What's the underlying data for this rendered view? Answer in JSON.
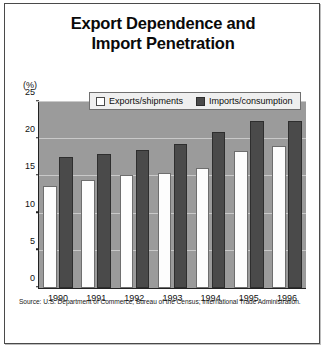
{
  "figure": {
    "title_line1": "Export Dependence and",
    "title_line2": "Import Penetration",
    "source": "Source: U.S. Department of Commerce; Bureau of the Census; International Trade Administration."
  },
  "chart_data": {
    "type": "bar",
    "title": "Export Dependence and Import Penetration",
    "xlabel": "",
    "ylabel": "(%)",
    "yunit": "(%)",
    "ylim": [
      0,
      25
    ],
    "yticks": [
      0,
      5,
      10,
      15,
      20,
      25
    ],
    "ytick_labels": [
      "0",
      "5",
      "10",
      "15",
      "20",
      "25"
    ],
    "grid": true,
    "legend_position": "top-center",
    "categories": [
      "1990",
      "1991",
      "1992",
      "1993",
      "1994",
      "1995",
      "1996"
    ],
    "series": [
      {
        "name": "Exports/shipments",
        "color": "#ffffff",
        "values": [
          13.7,
          14.5,
          15.2,
          15.4,
          16.1,
          18.4,
          19.1
        ]
      },
      {
        "name": "Imports/consumption",
        "color": "#4a4a4a",
        "values": [
          17.6,
          18.0,
          18.6,
          19.3,
          21.0,
          22.4,
          22.4
        ]
      }
    ]
  }
}
